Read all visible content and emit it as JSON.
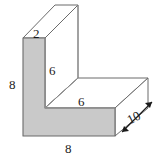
{
  "figure": {
    "kind": "l-shaped-prism-diagram",
    "colors": {
      "front_face_fill": "#c9c9c9",
      "top_face_fill": "#ffffff",
      "side_face_fill": "#ffffff",
      "outline": "#6b6b6b",
      "inner_edge": "#9a9a9a",
      "label_color": "#1a1a1a",
      "background": "#ffffff"
    },
    "labels": [
      {
        "name": "top-depth",
        "text": "2",
        "x": 33,
        "y": 27,
        "rotated": false
      },
      {
        "name": "left-height",
        "text": "8",
        "x": 9,
        "y": 78,
        "rotated": false
      },
      {
        "name": "inner-vertical",
        "text": "6",
        "x": 49,
        "y": 64,
        "rotated": false
      },
      {
        "name": "inner-horizontal",
        "text": "6",
        "x": 78,
        "y": 95,
        "rotated": false
      },
      {
        "name": "bottom-width",
        "text": "8",
        "x": 65,
        "y": 142,
        "rotated": false
      },
      {
        "name": "depth",
        "text": "10",
        "x": 128,
        "y": 114,
        "rotated": true
      }
    ],
    "dimensions": {
      "top_depth": "2",
      "left_height": "8",
      "inner_vertical": "6",
      "inner_horizontal": "6",
      "bottom_width": "8",
      "prism_depth": "10"
    },
    "arrow": {
      "name": "depth-double-arrow",
      "label": "10",
      "double_headed": true
    }
  }
}
